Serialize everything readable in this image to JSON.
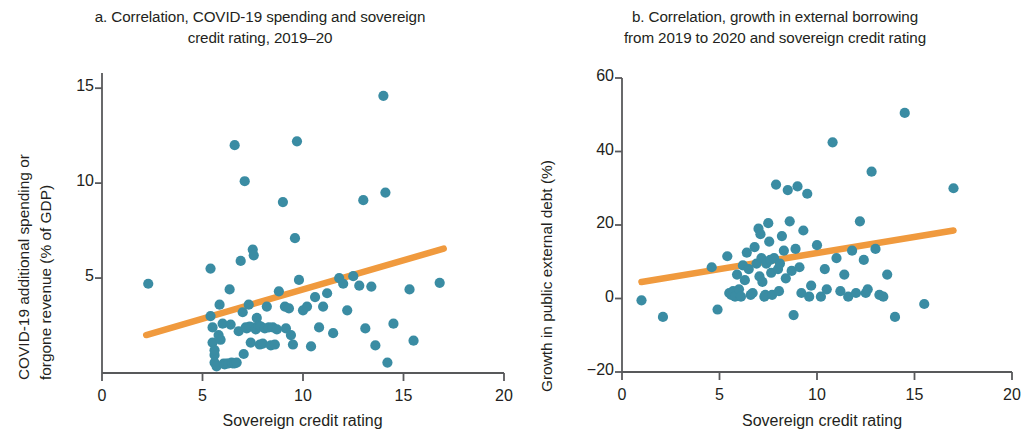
{
  "figure": {
    "background": "#ffffff",
    "point_color": "#3a8ca3",
    "trend_color": "#f09a3e",
    "axis_color": "#58595b",
    "text_color": "#231f20"
  },
  "panels": [
    {
      "id": "a",
      "title": "a. Correlation, COVID-19 spending and sovereign credit rating, 2019–20",
      "title_line_1": "a. Correlation, COVID-19 spending and sovereign",
      "title_line_2": "credit rating, 2019–20",
      "xlabel": "Sovereign credit rating",
      "ylabel_line_1": "COVID-19 additional spending or",
      "ylabel_line_2": "forgone revenue (% of GDP)",
      "xticks": [
        "0",
        "5",
        "10",
        "15",
        "20"
      ],
      "yticks": [
        "15",
        "10",
        "5"
      ]
    },
    {
      "id": "b",
      "title": "b. Correlation, growth in external borrowing from 2019 to 2020 and sovereign credit rating",
      "title_line_1": "b. Correlation, growth in external borrowing",
      "title_line_2": "from 2019 to 2020 and sovereign credit rating",
      "xlabel": "Sovereign credit rating",
      "ylabel_line_1": "Growth in public external debt (%)",
      "xticks": [
        "0",
        "5",
        "10",
        "15",
        "20"
      ],
      "yticks": [
        "60",
        "40",
        "20",
        "0",
        "−20"
      ]
    }
  ],
  "chart_data": [
    {
      "type": "scatter",
      "panel": "a",
      "title": "a. Correlation, COVID-19 spending and sovereign credit rating, 2019–20",
      "xlabel": "Sovereign credit rating",
      "ylabel": "COVID-19 additional spending or forgone revenue (% of GDP)",
      "xlim": [
        0,
        20
      ],
      "ylim": [
        0,
        15.8
      ],
      "xticks": [
        0,
        5,
        10,
        15,
        20
      ],
      "yticks": [
        5,
        10,
        15
      ],
      "grid": false,
      "legend": null,
      "point_color": "#3a8ca3",
      "points": [
        [
          2.3,
          4.7
        ],
        [
          5.4,
          5.5
        ],
        [
          5.4,
          3.0
        ],
        [
          5.5,
          2.4
        ],
        [
          5.5,
          1.6
        ],
        [
          5.6,
          0.95
        ],
        [
          5.6,
          0.55
        ],
        [
          5.6,
          1.2
        ],
        [
          5.7,
          0.35
        ],
        [
          5.8,
          2.0
        ],
        [
          5.85,
          3.6
        ],
        [
          5.9,
          1.75
        ],
        [
          6.0,
          2.6
        ],
        [
          6.05,
          0.5
        ],
        [
          6.1,
          0.45
        ],
        [
          6.2,
          0.5
        ],
        [
          6.3,
          0.5
        ],
        [
          6.35,
          4.4
        ],
        [
          6.4,
          2.55
        ],
        [
          6.45,
          0.55
        ],
        [
          6.5,
          0.5
        ],
        [
          6.6,
          0.5
        ],
        [
          6.6,
          12.0
        ],
        [
          6.7,
          0.55
        ],
        [
          6.8,
          2.2
        ],
        [
          6.9,
          5.9
        ],
        [
          7.0,
          3.2
        ],
        [
          7.05,
          1.0
        ],
        [
          7.1,
          10.1
        ],
        [
          7.15,
          2.4
        ],
        [
          7.2,
          2.35
        ],
        [
          7.3,
          3.6
        ],
        [
          7.35,
          2.45
        ],
        [
          7.4,
          1.6
        ],
        [
          7.5,
          6.5
        ],
        [
          7.55,
          6.2
        ],
        [
          7.6,
          2.4
        ],
        [
          7.65,
          2.3
        ],
        [
          7.7,
          2.9
        ],
        [
          7.8,
          2.5
        ],
        [
          7.85,
          1.5
        ],
        [
          7.9,
          2.45
        ],
        [
          8.0,
          1.55
        ],
        [
          8.1,
          2.35
        ],
        [
          8.2,
          3.5
        ],
        [
          8.3,
          2.4
        ],
        [
          8.4,
          1.45
        ],
        [
          8.5,
          2.4
        ],
        [
          8.6,
          1.5
        ],
        [
          8.7,
          2.3
        ],
        [
          8.8,
          4.3
        ],
        [
          9.0,
          9.0
        ],
        [
          9.1,
          3.5
        ],
        [
          9.15,
          2.35
        ],
        [
          9.3,
          3.4
        ],
        [
          9.4,
          2.0
        ],
        [
          9.5,
          1.5
        ],
        [
          9.6,
          7.1
        ],
        [
          9.7,
          12.2
        ],
        [
          9.8,
          4.9
        ],
        [
          10.0,
          3.3
        ],
        [
          10.2,
          3.5
        ],
        [
          10.4,
          1.4
        ],
        [
          10.6,
          4.0
        ],
        [
          10.8,
          2.4
        ],
        [
          11.0,
          3.5
        ],
        [
          11.2,
          4.2
        ],
        [
          11.5,
          2.1
        ],
        [
          11.8,
          5.0
        ],
        [
          12.0,
          4.7
        ],
        [
          12.2,
          3.3
        ],
        [
          12.5,
          5.1
        ],
        [
          12.8,
          4.6
        ],
        [
          13.0,
          9.1
        ],
        [
          13.1,
          2.35
        ],
        [
          13.4,
          4.55
        ],
        [
          13.6,
          1.45
        ],
        [
          14.0,
          14.6
        ],
        [
          14.1,
          9.5
        ],
        [
          14.2,
          0.55
        ],
        [
          14.5,
          2.6
        ],
        [
          15.3,
          4.4
        ],
        [
          15.5,
          1.7
        ],
        [
          16.8,
          4.75
        ]
      ],
      "trendline": {
        "type": "linear",
        "color": "#f09a3e",
        "x_start": 2.2,
        "y_start": 2.0,
        "x_end": 17.0,
        "y_end": 6.55
      }
    },
    {
      "type": "scatter",
      "panel": "b",
      "title": "b. Correlation, growth in external borrowing from 2019 to 2020 and sovereign credit rating",
      "xlabel": "Sovereign credit rating",
      "ylabel": "Growth in public external debt (%)",
      "xlim": [
        0,
        20
      ],
      "ylim": [
        -20,
        60
      ],
      "xticks": [
        0,
        5,
        10,
        15,
        20
      ],
      "yticks": [
        -20,
        0,
        20,
        40,
        60
      ],
      "grid": false,
      "legend": null,
      "point_color": "#3a8ca3",
      "points": [
        [
          1.0,
          -0.5
        ],
        [
          2.1,
          -5.0
        ],
        [
          4.6,
          8.5
        ],
        [
          4.9,
          -3.0
        ],
        [
          5.4,
          11.5
        ],
        [
          5.5,
          1.5
        ],
        [
          5.6,
          1.0
        ],
        [
          5.7,
          2.0
        ],
        [
          5.8,
          0.5
        ],
        [
          5.9,
          6.5
        ],
        [
          6.0,
          2.5
        ],
        [
          6.1,
          0.5
        ],
        [
          6.2,
          9.0
        ],
        [
          6.3,
          5.0
        ],
        [
          6.4,
          12.5
        ],
        [
          6.5,
          8.0
        ],
        [
          6.6,
          1.0
        ],
        [
          6.7,
          1.5
        ],
        [
          6.8,
          14.0
        ],
        [
          6.9,
          9.5
        ],
        [
          7.0,
          19.0
        ],
        [
          7.05,
          6.0
        ],
        [
          7.1,
          17.5
        ],
        [
          7.15,
          11.0
        ],
        [
          7.2,
          4.5
        ],
        [
          7.3,
          0.5
        ],
        [
          7.35,
          1.0
        ],
        [
          7.4,
          9.5
        ],
        [
          7.5,
          20.5
        ],
        [
          7.55,
          15.5
        ],
        [
          7.6,
          10.5
        ],
        [
          7.65,
          7.0
        ],
        [
          7.7,
          1.0
        ],
        [
          7.8,
          11.0
        ],
        [
          7.9,
          31.0
        ],
        [
          8.0,
          8.0
        ],
        [
          8.05,
          2.0
        ],
        [
          8.1,
          9.5
        ],
        [
          8.2,
          17.0
        ],
        [
          8.3,
          13.0
        ],
        [
          8.4,
          5.5
        ],
        [
          8.5,
          29.5
        ],
        [
          8.6,
          21.0
        ],
        [
          8.7,
          7.5
        ],
        [
          8.8,
          -4.5
        ],
        [
          8.9,
          13.5
        ],
        [
          9.0,
          30.5
        ],
        [
          9.1,
          8.5
        ],
        [
          9.2,
          1.5
        ],
        [
          9.3,
          18.5
        ],
        [
          9.5,
          28.5
        ],
        [
          9.6,
          0.5
        ],
        [
          9.7,
          3.5
        ],
        [
          10.0,
          14.5
        ],
        [
          10.2,
          0.5
        ],
        [
          10.4,
          8.0
        ],
        [
          10.5,
          2.5
        ],
        [
          10.8,
          42.5
        ],
        [
          11.0,
          11.0
        ],
        [
          11.2,
          2.0
        ],
        [
          11.4,
          6.5
        ],
        [
          11.6,
          0.5
        ],
        [
          11.8,
          13.0
        ],
        [
          12.0,
          1.5
        ],
        [
          12.2,
          21.0
        ],
        [
          12.4,
          10.5
        ],
        [
          12.5,
          1.5
        ],
        [
          12.6,
          2.5
        ],
        [
          12.8,
          34.5
        ],
        [
          13.0,
          13.5
        ],
        [
          13.2,
          1.0
        ],
        [
          13.4,
          0.5
        ],
        [
          13.6,
          6.5
        ],
        [
          14.0,
          -5.0
        ],
        [
          14.5,
          50.5
        ],
        [
          15.5,
          -1.5
        ],
        [
          17.0,
          30.0
        ]
      ],
      "trendline": {
        "type": "linear",
        "color": "#f09a3e",
        "x_start": 1.0,
        "y_start": 4.5,
        "x_end": 17.0,
        "y_end": 18.5
      }
    }
  ]
}
